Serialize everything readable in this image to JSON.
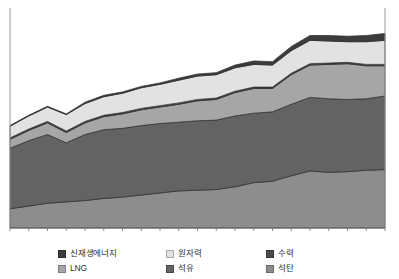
{
  "chart_data": {
    "type": "area",
    "stacked": true,
    "title": "",
    "xlabel": "",
    "ylabel": "",
    "grid": false,
    "legend_position": "bottom",
    "x": [
      1995,
      1996,
      1997,
      1998,
      1999,
      2000,
      2001,
      2002,
      2003,
      2004,
      2005,
      2006,
      2007,
      2008,
      2009,
      2010,
      2011,
      2012,
      2013,
      2014,
      2015
    ],
    "xticks": [
      "1995",
      "1997",
      "1999",
      "2001",
      "2003",
      "2005",
      "2007",
      "2009",
      "2011",
      "2013",
      "2015"
    ],
    "ylim": [
      0,
      320
    ],
    "series": [
      {
        "name": "석탄",
        "color": "#8d8d8d",
        "values": [
          28,
          32,
          36,
          38,
          40,
          43,
          45,
          48,
          51,
          54,
          55,
          56,
          60,
          66,
          68,
          76,
          83,
          81,
          82,
          84,
          85
        ]
      },
      {
        "name": "석유",
        "color": "#636363",
        "values": [
          88,
          95,
          100,
          86,
          96,
          100,
          100,
          101,
          101,
          100,
          101,
          101,
          103,
          101,
          101,
          104,
          107,
          107,
          105,
          104,
          107
        ]
      },
      {
        "name": "LNG",
        "color": "#a6a6a6",
        "values": [
          13,
          15,
          17,
          15,
          17,
          19,
          21,
          23,
          24,
          26,
          29,
          30,
          34,
          36,
          34,
          43,
          47,
          50,
          52,
          48,
          44
        ]
      },
      {
        "name": "수력",
        "color": "#4a4a4a",
        "values": [
          2,
          2,
          2,
          2,
          2,
          2,
          2,
          2,
          2,
          2,
          2,
          2,
          2,
          2,
          2,
          2,
          2,
          2,
          2,
          2,
          2
        ]
      },
      {
        "name": "원자력",
        "color": "#e2e2e2",
        "values": [
          17,
          19,
          21,
          24,
          26,
          27,
          28,
          30,
          31,
          33,
          34,
          34,
          34,
          33,
          32,
          33,
          34,
          32,
          30,
          33,
          35
        ]
      },
      {
        "name": "신재생에너지",
        "color": "#3c3c3c",
        "values": [
          1,
          1,
          1,
          1,
          2,
          2,
          2,
          2,
          2,
          3,
          3,
          3,
          4,
          5,
          5,
          6,
          7,
          8,
          8,
          9,
          10
        ]
      }
    ]
  },
  "axis": {
    "ticks": [
      "1995",
      "1997",
      "1999",
      "2001",
      "2003",
      "2005",
      "2007",
      "2009",
      "2011",
      "2013",
      "2015"
    ]
  },
  "legend": {
    "items": [
      {
        "label": "신재생에너지",
        "color": "#3c3c3c"
      },
      {
        "label": "원자력",
        "color": "#e2e2e2"
      },
      {
        "label": "수력",
        "color": "#4a4a4a"
      },
      {
        "label": "LNG",
        "color": "#a6a6a6"
      },
      {
        "label": "석유",
        "color": "#636363"
      },
      {
        "label": "석탄",
        "color": "#8d8d8d"
      }
    ]
  }
}
